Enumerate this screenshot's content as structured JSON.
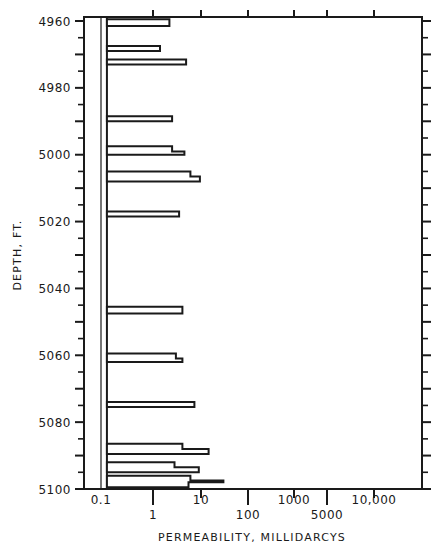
{
  "chart_data": {
    "type": "bar",
    "orientation": "horizontal",
    "title": "",
    "xlabel": "PERMEABILITY, MILLIDARCYS",
    "ylabel": "DEPTH, FT.",
    "x_scale": "log",
    "x_ticks": [
      {
        "value": 0.1,
        "label": "0.1",
        "row": 1
      },
      {
        "value": 1,
        "label": "1",
        "row": 2
      },
      {
        "value": 10,
        "label": "10",
        "row": 1
      },
      {
        "value": 100,
        "label": "100",
        "row": 2
      },
      {
        "value": 1000,
        "label": "1000",
        "row": 1
      },
      {
        "value": 5000,
        "label": "5000",
        "row": 2
      },
      {
        "value": 10000,
        "label": "10,000",
        "row": 1
      }
    ],
    "y_ticks": [
      4960,
      4980,
      5000,
      5020,
      5040,
      5060,
      5080,
      5100
    ],
    "y_tick_labels": [
      "4960",
      "4980",
      "5000",
      "5020",
      "5040",
      "5060",
      "5080",
      "5100"
    ],
    "y_minor_step": 5,
    "ylim": [
      4959,
      5100
    ],
    "y_inverted": true,
    "baseline_value": 0.13,
    "reference_line_value": 0.1,
    "grid": false,
    "legend": "none",
    "intervals": [
      {
        "top": 4959.5,
        "bottom": 4961.5,
        "value": 2.2
      },
      {
        "top": 4967.5,
        "bottom": 4969.0,
        "value": 1.4
      },
      {
        "top": 4971.5,
        "bottom": 4973.0,
        "value": 4.9
      },
      {
        "top": 4988.5,
        "bottom": 4990.0,
        "value": 2.5
      },
      {
        "top": 4997.5,
        "bottom": 4999.0,
        "value": 2.5
      },
      {
        "top": 4999.0,
        "bottom": 5000.0,
        "value": 4.5
      },
      {
        "top": 5005.0,
        "bottom": 5006.5,
        "value": 6.0
      },
      {
        "top": 5006.5,
        "bottom": 5008.0,
        "value": 9.5
      },
      {
        "top": 5017.0,
        "bottom": 5018.5,
        "value": 3.5
      },
      {
        "top": 5045.5,
        "bottom": 5047.5,
        "value": 4.1
      },
      {
        "top": 5059.5,
        "bottom": 5061.0,
        "value": 3.0
      },
      {
        "top": 5061.0,
        "bottom": 5062.0,
        "value": 4.1
      },
      {
        "top": 5074.0,
        "bottom": 5075.5,
        "value": 7.3
      },
      {
        "top": 5086.5,
        "bottom": 5088.0,
        "value": 4.1
      },
      {
        "top": 5088.0,
        "bottom": 5089.5,
        "value": 14.5
      },
      {
        "top": 5092.0,
        "bottom": 5093.5,
        "value": 2.8
      },
      {
        "top": 5093.5,
        "bottom": 5095.0,
        "value": 9.0
      },
      {
        "top": 5096.0,
        "bottom": 5097.5,
        "value": 6.0
      },
      {
        "top": 5097.5,
        "bottom": 5098.0,
        "value": 30.0
      },
      {
        "top": 5098.0,
        "bottom": 5099.5,
        "value": 5.5
      }
    ]
  }
}
